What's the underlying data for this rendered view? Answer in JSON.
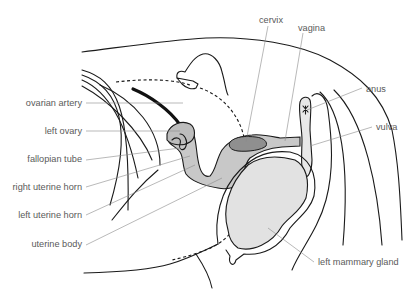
{
  "diagram": {
    "colors": {
      "uterus_fill": "#c8c8c8",
      "cervix_fill": "#8f8f8f",
      "mammary_fill": "#e2e2e2",
      "outline": "#1a1a1a",
      "label_text": "#5a5a5a",
      "leader_line": "#8a8a8a"
    },
    "labels": {
      "ovarian_artery": "ovarian artery",
      "left_ovary": "left ovary",
      "fallopian_tube": "fallopian tube",
      "right_uterine_horn": "right uterine horn",
      "left_uterine_horn": "left uterine horn",
      "uterine_body": "uterine body",
      "cervix": "cervix",
      "vagina": "vagina",
      "anus": "anus",
      "vulva": "vulva",
      "left_mammary_gland": "left mammary gland"
    }
  }
}
